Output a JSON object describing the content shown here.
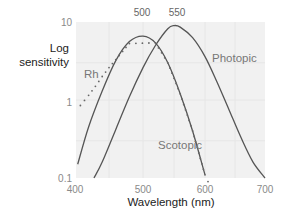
{
  "chart_data": {
    "type": "line",
    "title": "",
    "xlabel": "Wavelength (nm)",
    "ylabel": "Log sensitivity",
    "xlim": [
      400,
      700
    ],
    "ylim": [
      0.1,
      10
    ],
    "yscale": "log",
    "grid": true,
    "x_ticks": [
      "400",
      "500",
      "600",
      "700"
    ],
    "y_ticks": [
      "0.1",
      "1",
      "10"
    ],
    "peak_labels": [
      "500",
      "550"
    ],
    "series": [
      {
        "name": "Scotopic",
        "style": "solid",
        "x": [
          404,
          420,
          440,
          460,
          480,
          500,
          520,
          540,
          560,
          580,
          600
        ],
        "y": [
          0.15,
          0.45,
          1.3,
          3.2,
          5.6,
          6.6,
          5.4,
          3.0,
          1.2,
          0.4,
          0.11
        ]
      },
      {
        "name": "Photopic",
        "style": "solid",
        "x": [
          428,
          440,
          460,
          480,
          500,
          520,
          540,
          550,
          560,
          580,
          600,
          620,
          640,
          660,
          680,
          700
        ],
        "y": [
          0.1,
          0.16,
          0.42,
          1.1,
          2.6,
          5.0,
          8.2,
          9.0,
          8.6,
          6.3,
          3.6,
          1.7,
          0.75,
          0.33,
          0.16,
          0.1
        ]
      },
      {
        "name": "Rh",
        "style": "dotted",
        "x": [
          408,
          420,
          430,
          440,
          450,
          460,
          470,
          480,
          520,
          540,
          560,
          580,
          600,
          605
        ],
        "y": [
          0.85,
          1.15,
          1.5,
          2.0,
          2.6,
          3.3,
          4.2,
          5.3,
          5.4,
          3.0,
          1.2,
          0.4,
          0.11,
          0.09
        ]
      }
    ],
    "annotations": [
      "Rh",
      "Photopic",
      "Scotopic"
    ]
  }
}
